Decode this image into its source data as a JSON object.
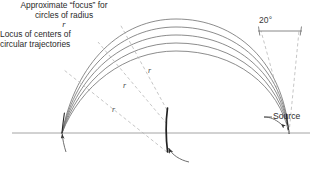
{
  "figure": {
    "baseline": {
      "y": 133,
      "x_start": 12,
      "x_end": 310,
      "color": "#9a9a9a"
    },
    "source_point": {
      "x": 289,
      "y": 133
    },
    "focus_point": {
      "x": 62,
      "y": 133
    },
    "arc_count": 5,
    "arc_color": "#6e6e6e",
    "dashed_color": "#b5b5b5",
    "locus_color": "#222222"
  },
  "labels": {
    "angle": "20°",
    "source": "Source",
    "radius_marks": [
      {
        "id": "r-top",
        "text": "r",
        "x": 148,
        "y": 66
      },
      {
        "id": "r-mid",
        "text": "r",
        "x": 123,
        "y": 81
      },
      {
        "id": "r-low",
        "text": "r",
        "x": 112,
        "y": 105
      }
    ]
  },
  "captions": {
    "focus": {
      "line1": "Approximate “focus” for",
      "line2_prefix": "circles of radius ",
      "line2_symbol": "r"
    },
    "locus": {
      "line1": "Locus of centers of",
      "line2": "circular trajectories"
    }
  }
}
